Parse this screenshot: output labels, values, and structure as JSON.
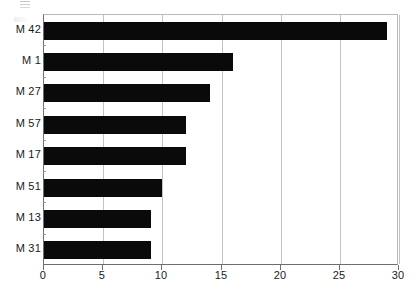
{
  "chart": {
    "type": "bar",
    "orientation": "horizontal",
    "title": "",
    "background_color": "#ffffff",
    "bar_color": "#0a0a0a",
    "gridline_color": "#c2c2c2",
    "axis_color": "#6e6e6e"
  },
  "chart_data": {
    "type": "bar",
    "orientation": "horizontal",
    "title": "",
    "xlabel": "",
    "ylabel": "",
    "categories": [
      "M 42",
      "M 1",
      "M 27",
      "M 57",
      "M 17",
      "M 51",
      "M 13",
      "M 31"
    ],
    "values": [
      29,
      16,
      14,
      12,
      12,
      10,
      9,
      9
    ],
    "xlim": [
      0,
      30
    ],
    "xticks": [
      0,
      5,
      10,
      15,
      20,
      25,
      30
    ],
    "xtick_labels": [
      "0",
      "5",
      "10",
      "15",
      "20",
      "25",
      "30"
    ],
    "grid": "vertical",
    "legend": "none",
    "series": [
      {
        "name": "count",
        "values": [
          29,
          16,
          14,
          12,
          12,
          10,
          9,
          9
        ]
      }
    ]
  }
}
